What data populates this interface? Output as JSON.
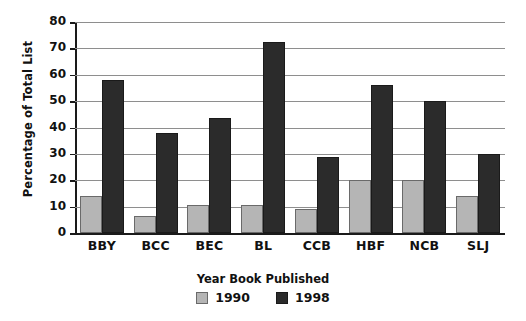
{
  "chart_data": {
    "type": "bar",
    "title": "",
    "xlabel": "Year Book Published",
    "ylabel": "Percentage of Total List",
    "ylim": [
      0,
      80
    ],
    "ytick_step": 10,
    "yticks": [
      "80",
      "70",
      "60",
      "50",
      "40",
      "30",
      "20",
      "10",
      "0"
    ],
    "grid": true,
    "legend_position": "bottom",
    "categories": [
      "BBY",
      "BCC",
      "BEC",
      "BL",
      "CCB",
      "HBF",
      "NCB",
      "SLJ"
    ],
    "series": [
      {
        "name": "1990",
        "color": "#b5b5b5",
        "values": [
          14,
          6.5,
          10.5,
          10.5,
          9,
          20,
          20,
          14
        ]
      },
      {
        "name": "1998",
        "color": "#2b2b2b",
        "values": [
          58,
          38,
          43.5,
          72.5,
          29,
          56,
          50,
          30
        ]
      }
    ]
  }
}
